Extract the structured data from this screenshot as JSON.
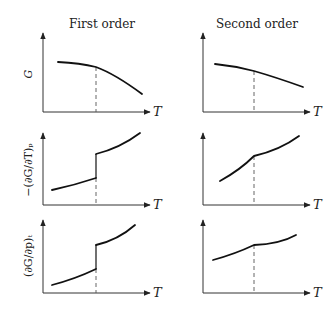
{
  "columns": [
    {
      "title": "First order",
      "transition_type": "discontinuous"
    },
    {
      "title": "Second order",
      "transition_type": "continuous-kink"
    }
  ],
  "rows": [
    {
      "ylabel": "G"
    },
    {
      "ylabel": "−(∂G/∂T)ₚ"
    },
    {
      "ylabel": "(∂G/∂p)ₜ"
    }
  ],
  "xlabel": "T",
  "panels": [
    {
      "row": 0,
      "col": 0,
      "description": "G vs T, slope changes abruptly at transition (kink)"
    },
    {
      "row": 0,
      "col": 1,
      "description": "G vs T, smooth change at transition"
    },
    {
      "row": 1,
      "col": 0,
      "description": "Entropy jumps discontinuously at transition"
    },
    {
      "row": 1,
      "col": 1,
      "description": "Entropy continuous with slope change at transition"
    },
    {
      "row": 2,
      "col": 0,
      "description": "Volume jumps discontinuously at transition"
    },
    {
      "row": 2,
      "col": 1,
      "description": "Volume continuous with slope change at transition"
    }
  ],
  "colors": {
    "curve": "#111111",
    "axis": "#333333",
    "dash": "#555555"
  }
}
